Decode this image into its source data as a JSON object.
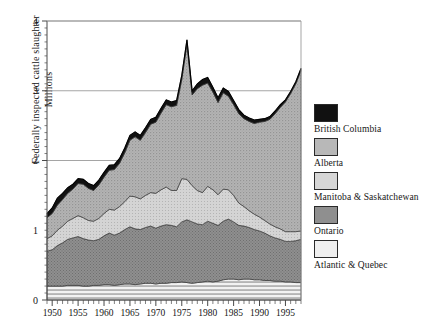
{
  "chart_data": {
    "type": "area",
    "title": "",
    "subtitle": "",
    "xlabel": "",
    "ylabel": "Federally inspected cattle slaughter",
    "ylabel_line2": "Millions",
    "ylim": [
      0,
      4
    ],
    "xlim": [
      1949,
      1998
    ],
    "grid": true,
    "gridlines_y": [
      2,
      3,
      4
    ],
    "ytick_labels": [
      "0",
      "1",
      "2",
      "3",
      "4"
    ],
    "ytick_values": [
      0,
      1,
      2,
      3,
      4
    ],
    "xtick_labels": [
      "1950",
      "1955",
      "1960",
      "1965",
      "1970",
      "1975",
      "1980",
      "1985",
      "1990",
      "1995"
    ],
    "xtick_values": [
      1950,
      1955,
      1960,
      1965,
      1970,
      1975,
      1980,
      1985,
      1990,
      1995
    ],
    "minor_xticks_every": 1,
    "legend_position": "right",
    "stacked": true,
    "stack_order_bottom_to_top": [
      "Atlantic & Quebec",
      "Ontario",
      "Manitoba & Saskatchewan",
      "Alberta",
      "British Columbia"
    ],
    "x": [
      1949,
      1950,
      1951,
      1952,
      1953,
      1954,
      1955,
      1956,
      1957,
      1958,
      1959,
      1960,
      1961,
      1962,
      1963,
      1964,
      1965,
      1966,
      1967,
      1968,
      1969,
      1970,
      1971,
      1972,
      1973,
      1974,
      1975,
      1976,
      1977,
      1978,
      1979,
      1980,
      1981,
      1982,
      1983,
      1984,
      1985,
      1986,
      1987,
      1988,
      1989,
      1990,
      1991,
      1992,
      1993,
      1994,
      1995,
      1996,
      1997,
      1998
    ],
    "series": [
      {
        "name": "Atlantic & Quebec",
        "fill": "#e3e3e3",
        "pattern": "horizontal-lines",
        "values": [
          0.2,
          0.2,
          0.2,
          0.2,
          0.21,
          0.21,
          0.21,
          0.2,
          0.2,
          0.21,
          0.21,
          0.22,
          0.22,
          0.21,
          0.22,
          0.23,
          0.23,
          0.22,
          0.23,
          0.24,
          0.24,
          0.23,
          0.24,
          0.24,
          0.25,
          0.25,
          0.26,
          0.25,
          0.24,
          0.25,
          0.26,
          0.27,
          0.26,
          0.27,
          0.29,
          0.3,
          0.3,
          0.29,
          0.3,
          0.3,
          0.29,
          0.29,
          0.28,
          0.28,
          0.27,
          0.27,
          0.26,
          0.26,
          0.25,
          0.25
        ]
      },
      {
        "name": "Ontario",
        "fill": "#8c8c8c",
        "pattern": "cross-hatch",
        "values": [
          0.5,
          0.52,
          0.58,
          0.62,
          0.66,
          0.68,
          0.7,
          0.68,
          0.66,
          0.64,
          0.66,
          0.7,
          0.74,
          0.72,
          0.74,
          0.78,
          0.82,
          0.8,
          0.78,
          0.8,
          0.82,
          0.8,
          0.82,
          0.84,
          0.82,
          0.8,
          0.86,
          0.9,
          0.88,
          0.84,
          0.82,
          0.86,
          0.84,
          0.8,
          0.84,
          0.86,
          0.82,
          0.78,
          0.76,
          0.74,
          0.72,
          0.7,
          0.68,
          0.64,
          0.62,
          0.6,
          0.58,
          0.58,
          0.6,
          0.62
        ]
      },
      {
        "name": "Manitoba & Saskatchewan",
        "fill": "#cfcfcf",
        "pattern": "fine-dots",
        "values": [
          0.18,
          0.2,
          0.22,
          0.24,
          0.26,
          0.28,
          0.3,
          0.3,
          0.28,
          0.28,
          0.3,
          0.32,
          0.34,
          0.36,
          0.38,
          0.4,
          0.44,
          0.46,
          0.44,
          0.46,
          0.48,
          0.5,
          0.52,
          0.54,
          0.5,
          0.52,
          0.62,
          0.58,
          0.52,
          0.48,
          0.46,
          0.5,
          0.48,
          0.44,
          0.46,
          0.42,
          0.38,
          0.32,
          0.28,
          0.24,
          0.22,
          0.2,
          0.18,
          0.17,
          0.16,
          0.15,
          0.14,
          0.14,
          0.13,
          0.12
        ]
      },
      {
        "name": "Alberta",
        "fill": "#b0b0b0",
        "pattern": "coarse-dots",
        "values": [
          0.3,
          0.32,
          0.36,
          0.38,
          0.4,
          0.42,
          0.46,
          0.48,
          0.46,
          0.44,
          0.48,
          0.52,
          0.56,
          0.58,
          0.62,
          0.7,
          0.8,
          0.86,
          0.84,
          0.9,
          0.98,
          1.02,
          1.1,
          1.18,
          1.2,
          1.22,
          1.42,
          1.94,
          1.3,
          1.46,
          1.54,
          1.48,
          1.4,
          1.32,
          1.38,
          1.34,
          1.3,
          1.28,
          1.26,
          1.28,
          1.3,
          1.36,
          1.42,
          1.5,
          1.62,
          1.74,
          1.86,
          1.98,
          2.12,
          2.3
        ]
      },
      {
        "name": "British Columbia",
        "fill": "#111111",
        "pattern": "solid",
        "values": [
          0.06,
          0.08,
          0.1,
          0.09,
          0.08,
          0.07,
          0.07,
          0.07,
          0.07,
          0.07,
          0.07,
          0.07,
          0.07,
          0.07,
          0.07,
          0.07,
          0.07,
          0.07,
          0.07,
          0.07,
          0.07,
          0.07,
          0.07,
          0.07,
          0.07,
          0.07,
          0.06,
          0.06,
          0.06,
          0.07,
          0.08,
          0.08,
          0.07,
          0.07,
          0.07,
          0.07,
          0.06,
          0.06,
          0.05,
          0.05,
          0.05,
          0.04,
          0.04,
          0.04,
          0.04,
          0.04,
          0.03,
          0.03,
          0.03,
          0.03
        ]
      }
    ],
    "totals": [
      1.24,
      1.32,
      1.46,
      1.53,
      1.61,
      1.66,
      1.74,
      1.73,
      1.67,
      1.64,
      1.72,
      1.83,
      1.93,
      1.94,
      2.03,
      2.18,
      2.36,
      2.41,
      2.36,
      2.47,
      2.59,
      2.62,
      2.75,
      2.87,
      2.84,
      2.86,
      3.22,
      3.73,
      3.0,
      3.1,
      3.16,
      3.19,
      3.05,
      2.9,
      3.04,
      2.99,
      2.86,
      2.73,
      2.65,
      2.61,
      2.58,
      2.59,
      2.6,
      2.63,
      2.71,
      2.8,
      2.87,
      2.99,
      3.13,
      3.32
    ]
  },
  "legend": {
    "entries": [
      {
        "label": "British Columbia"
      },
      {
        "label": "Alberta"
      },
      {
        "label": "Manitoba & Saskatchewan"
      },
      {
        "label": "Ontario"
      },
      {
        "label": "Atlantic & Quebec"
      }
    ]
  }
}
